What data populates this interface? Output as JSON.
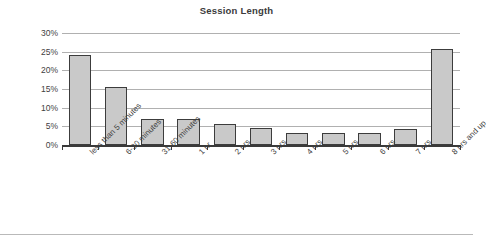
{
  "chart_data": {
    "type": "bar",
    "title": "Session Length",
    "xlabel": "",
    "ylabel": "",
    "ylim": [
      0,
      30
    ],
    "ytick_labels": [
      "30%",
      "25%",
      "20%",
      "15%",
      "10%",
      "5%",
      "0%"
    ],
    "ytick_values": [
      30,
      25,
      20,
      15,
      10,
      5,
      0
    ],
    "grid": "horizontal",
    "legend": "none",
    "categories": [
      "less than 5 minutes",
      "6-30 minutes",
      "31-60 minutes",
      "1 hr",
      "2 hrs",
      "3 hrs",
      "4 hrs",
      "5 hrs",
      "6 hrs",
      "7 hrs",
      "8 hrs and up"
    ],
    "values": [
      24,
      15.5,
      7,
      7,
      5.5,
      4.5,
      3.3,
      3.2,
      3.3,
      4.3,
      25.8
    ],
    "bar_fill": "#c9c9c9",
    "bar_border": "#3c3c3c",
    "gridline_color": "#b0b0b0",
    "axis_color": "#3a3a3a",
    "text_color": "#3f3f3f"
  }
}
